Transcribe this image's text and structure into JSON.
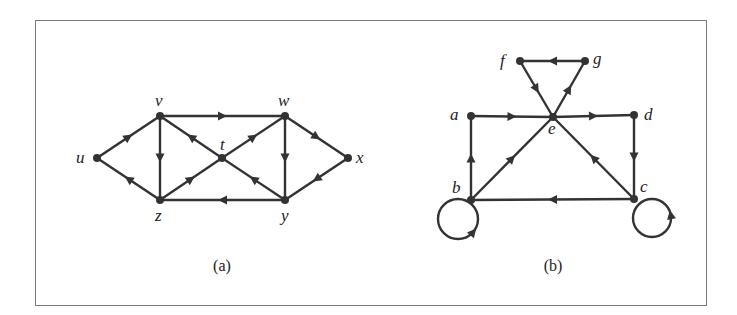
{
  "figure": {
    "border_color": "#7a7a7a",
    "edge_color": "#333333",
    "graphs": [
      {
        "caption": "(a)",
        "caption_pos": [
          222,
          271
        ],
        "nodes": [
          {
            "id": "u",
            "x": 97,
            "y": 158,
            "lx": 76,
            "ly": 163
          },
          {
            "id": "v",
            "x": 160,
            "y": 116,
            "lx": 155,
            "ly": 106
          },
          {
            "id": "z",
            "x": 160,
            "y": 200,
            "lx": 155,
            "ly": 221
          },
          {
            "id": "t",
            "x": 222,
            "y": 158,
            "lx": 220,
            "ly": 150
          },
          {
            "id": "w",
            "x": 285,
            "y": 116,
            "lx": 278,
            "ly": 106
          },
          {
            "id": "x",
            "x": 348,
            "y": 158,
            "lx": 356,
            "ly": 163
          },
          {
            "id": "y",
            "x": 285,
            "y": 200,
            "lx": 281,
            "ly": 221
          }
        ],
        "edges": [
          {
            "from": "u",
            "to": "v"
          },
          {
            "from": "z",
            "to": "u"
          },
          {
            "from": "v",
            "to": "w"
          },
          {
            "from": "v",
            "to": "z"
          },
          {
            "from": "t",
            "to": "v"
          },
          {
            "from": "z",
            "to": "t"
          },
          {
            "from": "t",
            "to": "w"
          },
          {
            "from": "y",
            "to": "t"
          },
          {
            "from": "w",
            "to": "y"
          },
          {
            "from": "w",
            "to": "x"
          },
          {
            "from": "x",
            "to": "y"
          },
          {
            "from": "y",
            "to": "z"
          }
        ],
        "loops": []
      },
      {
        "caption": "(b)",
        "caption_pos": [
          553,
          271
        ],
        "nodes": [
          {
            "id": "f",
            "x": 520,
            "y": 61,
            "lx": 500,
            "ly": 66
          },
          {
            "id": "g",
            "x": 585,
            "y": 61,
            "lx": 593,
            "ly": 64
          },
          {
            "id": "a",
            "x": 471,
            "y": 116,
            "lx": 450,
            "ly": 120
          },
          {
            "id": "e",
            "x": 553,
            "y": 117,
            "lx": 548,
            "ly": 134
          },
          {
            "id": "d",
            "x": 634,
            "y": 115,
            "lx": 644,
            "ly": 120
          },
          {
            "id": "b",
            "x": 471,
            "y": 200,
            "lx": 452,
            "ly": 193
          },
          {
            "id": "c",
            "x": 634,
            "y": 199,
            "lx": 640,
            "ly": 192
          }
        ],
        "edges": [
          {
            "from": "a",
            "to": "e"
          },
          {
            "from": "e",
            "to": "d"
          },
          {
            "from": "d",
            "to": "c"
          },
          {
            "from": "c",
            "to": "b"
          },
          {
            "from": "b",
            "to": "a"
          },
          {
            "from": "b",
            "to": "e"
          },
          {
            "from": "c",
            "to": "e"
          },
          {
            "from": "f",
            "to": "e"
          },
          {
            "from": "e",
            "to": "g"
          },
          {
            "from": "g",
            "to": "f"
          }
        ],
        "loops": [
          {
            "node": "b",
            "cx": 458,
            "cy": 219,
            "r": 20,
            "arrow_angle": 40,
            "dir": "ccw"
          },
          {
            "node": "c",
            "cx": 652,
            "cy": 218,
            "r": 19,
            "arrow_angle": -10,
            "dir": "ccw"
          }
        ]
      }
    ]
  }
}
